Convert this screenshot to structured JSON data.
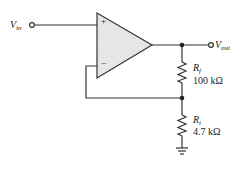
{
  "diagram": {
    "type": "non-inverting op-amp amplifier",
    "input": {
      "symbol": "V",
      "subscript": "in"
    },
    "output": {
      "symbol": "V",
      "subscript": "out"
    },
    "opamp": {
      "plus_label": "+",
      "minus_label": "−"
    },
    "resistors": [
      {
        "symbol": "R",
        "subscript": "f",
        "value": "100 kΩ"
      },
      {
        "symbol": "R",
        "subscript": "i",
        "value": "4.7 kΩ"
      }
    ],
    "colors": {
      "wire": "#333333",
      "opamp_fill": "#e6e6e6"
    }
  }
}
